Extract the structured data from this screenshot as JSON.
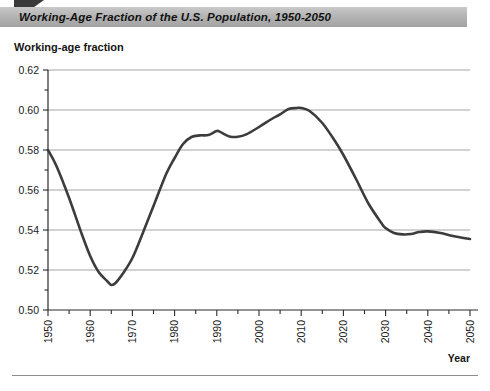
{
  "header": {
    "title": "Working-Age Fraction of the U.S. Population, 1950-2050"
  },
  "axes": {
    "y_caption": "Working-age fraction",
    "x_caption": "Year"
  },
  "chart_data": {
    "type": "line",
    "title": "Working-Age Fraction of the U.S. Population, 1950-2050",
    "xlabel": "Year",
    "ylabel": "Working-age fraction",
    "xlim": [
      1950,
      2050
    ],
    "ylim": [
      0.5,
      0.62
    ],
    "grid": true,
    "legend": false,
    "y_ticks": [
      "0.50",
      "0.52",
      "0.54",
      "0.56",
      "0.58",
      "0.60",
      "0.62"
    ],
    "y_tick_values": [
      0.5,
      0.52,
      0.54,
      0.56,
      0.58,
      0.6,
      0.62
    ],
    "y_minor_tick_values": [
      0.51,
      0.53,
      0.55,
      0.57,
      0.59,
      0.61
    ],
    "x_ticks": [
      "1950",
      "1960",
      "1970",
      "1980",
      "1990",
      "2000",
      "2010",
      "2020",
      "2030",
      "2040",
      "2050"
    ],
    "x_tick_values": [
      1950,
      1960,
      1970,
      1980,
      1990,
      2000,
      2010,
      2020,
      2030,
      2040,
      2050
    ],
    "x_minor_tick_values": [
      1955,
      1965,
      1975,
      1985,
      1995,
      2005,
      2015,
      2025,
      2035,
      2045
    ],
    "line_color": "#3c3c3c",
    "line_width": 2.6,
    "series": [
      {
        "name": "Working-age fraction",
        "x": [
          1950,
          1952,
          1955,
          1958,
          1960,
          1962,
          1964,
          1965,
          1966,
          1968,
          1970,
          1972,
          1975,
          1978,
          1980,
          1982,
          1984,
          1986,
          1988,
          1990,
          1991,
          1993,
          1995,
          1997,
          2000,
          2003,
          2005,
          2007,
          2009,
          2010,
          2012,
          2015,
          2018,
          2020,
          2023,
          2026,
          2029,
          2030,
          2032,
          2034,
          2036,
          2038,
          2040,
          2043,
          2046,
          2050
        ],
        "values": [
          0.58,
          0.572,
          0.556,
          0.538,
          0.527,
          0.519,
          0.5145,
          0.5125,
          0.5135,
          0.519,
          0.526,
          0.536,
          0.552,
          0.568,
          0.576,
          0.583,
          0.5865,
          0.5873,
          0.5875,
          0.5895,
          0.5888,
          0.5868,
          0.5866,
          0.5878,
          0.5915,
          0.5955,
          0.5978,
          0.6005,
          0.601,
          0.601,
          0.5995,
          0.5935,
          0.5845,
          0.5775,
          0.5655,
          0.553,
          0.5435,
          0.541,
          0.5385,
          0.5378,
          0.538,
          0.539,
          0.5393,
          0.5385,
          0.537,
          0.5355
        ]
      }
    ]
  }
}
